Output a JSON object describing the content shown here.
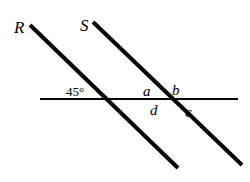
{
  "figure": {
    "background_color": "#ffffff",
    "stroke_color": "#000000",
    "width": 250,
    "height": 182
  },
  "lines": {
    "horizontal": {
      "name": "horizontal-line",
      "x1": 40,
      "y1": 99,
      "x2": 238,
      "y2": 99,
      "thickness": 2
    },
    "transversal_r": {
      "name": "line-R",
      "x1": 30,
      "y1": 25,
      "x2": 178,
      "y2": 168,
      "thickness": 4
    },
    "transversal_s": {
      "name": "line-S",
      "x1": 93,
      "y1": 22,
      "x2": 242,
      "y2": 165,
      "thickness": 4
    }
  },
  "intersections": {
    "first": {
      "x": 103,
      "y": 99
    },
    "second": {
      "x": 167,
      "y": 99
    }
  },
  "labels": {
    "line_r": "R",
    "line_s": "S",
    "angle_measure": "45°",
    "angle_a": "a",
    "angle_b": "b",
    "angle_c": "c",
    "angle_d": "d"
  },
  "chart_data": {
    "type": "diagram",
    "elements": [
      {
        "id": "horizontal",
        "kind": "line",
        "label": "",
        "from": [
          40,
          99
        ],
        "to": [
          238,
          99
        ]
      },
      {
        "id": "R",
        "kind": "line",
        "label": "R",
        "from": [
          30,
          25
        ],
        "to": [
          178,
          168
        ]
      },
      {
        "id": "S",
        "kind": "line",
        "label": "S",
        "from": [
          93,
          22
        ],
        "to": [
          242,
          165
        ]
      }
    ],
    "angles": [
      {
        "label": "45°",
        "value": 45,
        "at": [
          103,
          99
        ],
        "position": "upper-left"
      },
      {
        "label": "a",
        "value": null,
        "at": [
          167,
          99
        ],
        "position": "upper-left"
      },
      {
        "label": "b",
        "value": null,
        "at": [
          167,
          99
        ],
        "position": "upper-right"
      },
      {
        "label": "c",
        "value": null,
        "at": [
          167,
          99
        ],
        "position": "lower-right"
      },
      {
        "label": "d",
        "value": null,
        "at": [
          167,
          99
        ],
        "position": "lower-left"
      }
    ]
  }
}
